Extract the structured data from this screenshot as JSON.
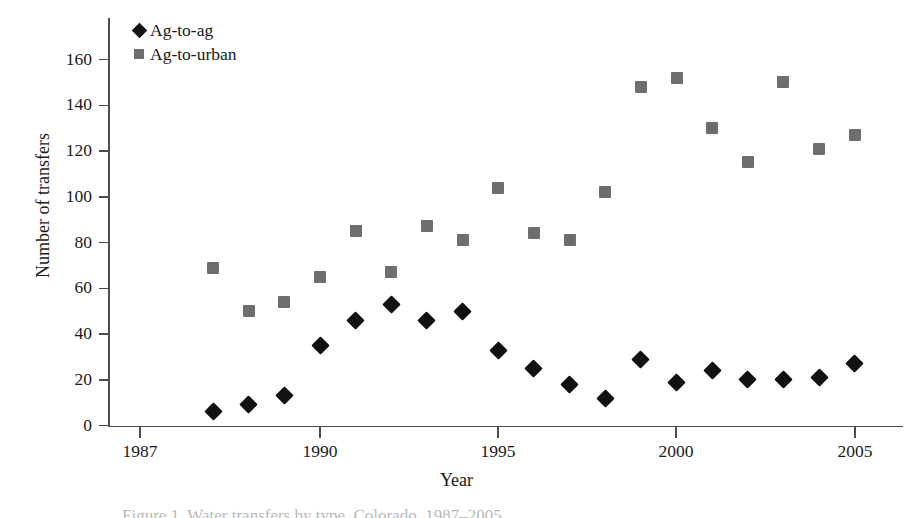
{
  "figure": {
    "background_color": "#ffffff",
    "caption": "Figure 1. Water transfers by type, Colorado, 1987–2005"
  },
  "chart_data": {
    "type": "scatter",
    "title": "",
    "xlabel": "Year",
    "ylabel": "Number of transfers",
    "x": [
      1987,
      1988,
      1989,
      1990,
      1991,
      1992,
      1993,
      1994,
      1995,
      1996,
      1997,
      1998,
      1999,
      2000,
      2001,
      2002,
      2003,
      2004,
      2005
    ],
    "xlim": [
      1986,
      2005.6
    ],
    "ylim": [
      0,
      170
    ],
    "xticks": [
      1987,
      1990,
      1995,
      2000,
      2005
    ],
    "xtick_labels": [
      "1987",
      "1990",
      "1995",
      "2000",
      "2005"
    ],
    "yticks": [
      0,
      20,
      40,
      60,
      80,
      100,
      120,
      140,
      160
    ],
    "ytick_labels": [
      "0",
      "20",
      "40",
      "60",
      "80",
      "100",
      "120",
      "140",
      "160"
    ],
    "grid": false,
    "legend_position": "top-left",
    "series": [
      {
        "name": "Ag-to-ag",
        "marker": "diamond",
        "color": "#111111",
        "values": [
          6,
          9,
          13,
          35,
          46,
          53,
          46,
          50,
          33,
          25,
          18,
          12,
          29,
          19,
          24,
          20,
          20,
          21,
          27
        ]
      },
      {
        "name": "Ag-to-urban",
        "marker": "square",
        "color": "#6e6e6e",
        "values": [
          69,
          50,
          54,
          65,
          85,
          67,
          87,
          81,
          104,
          84,
          81,
          102,
          148,
          152,
          130,
          115,
          150,
          121,
          127
        ]
      }
    ]
  },
  "legend": {
    "items": [
      {
        "label": "Ag-to-ag",
        "marker": "diamond",
        "color": "#111111"
      },
      {
        "label": "Ag-to-urban",
        "marker": "square",
        "color": "#6e6e6e"
      }
    ]
  }
}
